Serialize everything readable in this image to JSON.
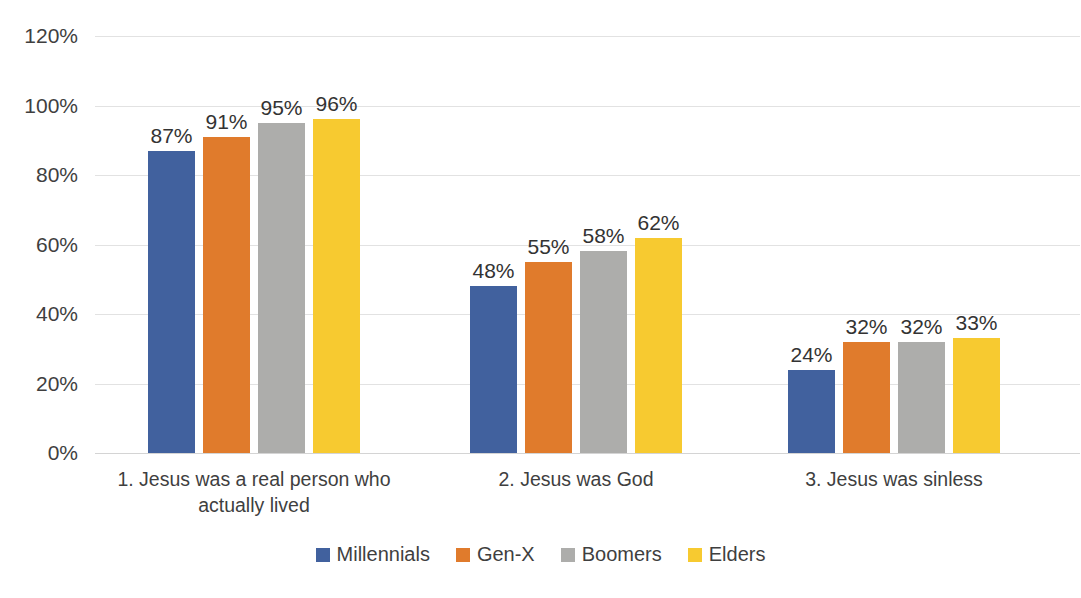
{
  "chart_data": {
    "type": "bar",
    "title": "",
    "subtitle": "",
    "xlabel": "",
    "ylabel": "",
    "ylim": [
      0,
      120
    ],
    "ytick_labels": [
      "120%",
      "100%",
      "80%",
      "60%",
      "40%",
      "20%",
      "0%"
    ],
    "ytick_values": [
      120,
      100,
      80,
      60,
      40,
      20,
      0
    ],
    "grid": true,
    "legend_position": "bottom",
    "categories": [
      "1. Jesus was a real person who actually lived",
      "2. Jesus was God",
      "3. Jesus was sinless"
    ],
    "category_lines": [
      [
        "1. Jesus was a real person who",
        "actually lived"
      ],
      [
        "2. Jesus was God"
      ],
      [
        "3. Jesus was sinless"
      ]
    ],
    "series": [
      {
        "name": "Millennials",
        "color": "#41619E",
        "values": [
          87,
          48,
          24
        ],
        "labels": [
          "87%",
          "48%",
          "24%"
        ]
      },
      {
        "name": "Gen-X",
        "color": "#E07B2C",
        "values": [
          91,
          55,
          32
        ],
        "labels": [
          "91%",
          "55%",
          "32%"
        ]
      },
      {
        "name": "Boomers",
        "color": "#ADADAB",
        "values": [
          95,
          58,
          32
        ],
        "labels": [
          "95%",
          "58%",
          "32%"
        ]
      },
      {
        "name": "Elders",
        "color": "#F7CA30",
        "values": [
          96,
          62,
          33
        ],
        "labels": [
          "96%",
          "62%",
          "33%"
        ]
      }
    ]
  }
}
